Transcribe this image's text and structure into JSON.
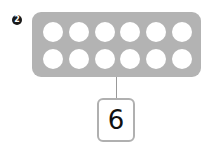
{
  "problem": {
    "number": "2"
  },
  "ten_frame": {
    "rows": 2,
    "columns": 6,
    "total_circles": 12,
    "filled": 0,
    "panel_color": "#b3b3b3",
    "circle_color": "#ffffff"
  },
  "answer": {
    "value": "6"
  }
}
